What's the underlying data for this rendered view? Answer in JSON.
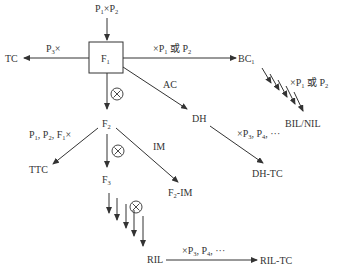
{
  "diagram": {
    "type": "breeding-population-flowchart",
    "colors": {
      "line": "#333333",
      "background": "#ffffff"
    },
    "nodes": {
      "parents": {
        "label": "P1×P2",
        "main": [
          "P",
          "×P"
        ],
        "subs": [
          "1",
          "2"
        ]
      },
      "f1": {
        "label": "F1",
        "main": "F",
        "sub": "1"
      },
      "tc": {
        "label": "TC"
      },
      "bc1": {
        "label": "BC1",
        "main": "BC",
        "sub": "1"
      },
      "bil_nil": {
        "label": "BIL/NIL"
      },
      "dh": {
        "label": "DH"
      },
      "dh_tc": {
        "label": "DH-TC"
      },
      "f2": {
        "label": "F2",
        "main": "F",
        "sub": "2"
      },
      "ttc": {
        "label": "TTC"
      },
      "f3": {
        "label": "F3",
        "main": "F",
        "sub": "3"
      },
      "f2_im": {
        "label": "F2-IM",
        "main": [
          "F",
          "-IM"
        ],
        "sub": "2"
      },
      "ril": {
        "label": "RIL"
      },
      "ril_tc": {
        "label": "RIL-TC"
      }
    },
    "edges": [
      {
        "from": "parents",
        "to": "f1",
        "label": ""
      },
      {
        "from": "f1",
        "to": "tc",
        "label": "P3×",
        "parts": [
          "P",
          "3",
          "×"
        ]
      },
      {
        "from": "f1",
        "to": "bc1",
        "label": "×P1 或 P2",
        "parts": [
          "×P",
          "1",
          " 或 P",
          "2"
        ]
      },
      {
        "from": "f1",
        "to": "dh",
        "label": "AC"
      },
      {
        "from": "f1",
        "to": "f2",
        "label": "⊗",
        "symbol": "selfing-icon"
      },
      {
        "from": "bc1",
        "to": "bil_nil",
        "label": "×P1 或 P2",
        "parts": [
          "×P",
          "1",
          " 或 P",
          "2"
        ],
        "repeated": true
      },
      {
        "from": "dh",
        "to": "dh_tc",
        "label": "×P3, P4, ···",
        "parts": [
          "×P",
          "3",
          ", P",
          "4",
          ", ···"
        ]
      },
      {
        "from": "f2",
        "to": "ttc",
        "label": "P1, P2, F1×",
        "parts": [
          "P",
          "1",
          ", P",
          "2",
          ", F",
          "1",
          "×"
        ]
      },
      {
        "from": "f2",
        "to": "f3",
        "label": "⊗",
        "symbol": "selfing-icon"
      },
      {
        "from": "f2",
        "to": "f2_im",
        "label": "IM"
      },
      {
        "from": "f3",
        "to": "ril",
        "label": "⊗",
        "symbol": "selfing-icon",
        "repeated": true
      },
      {
        "from": "ril",
        "to": "ril_tc",
        "label": "×P3, P4, ···",
        "parts": [
          "×P",
          "3",
          ", P",
          "4",
          ", ···"
        ]
      }
    ]
  }
}
